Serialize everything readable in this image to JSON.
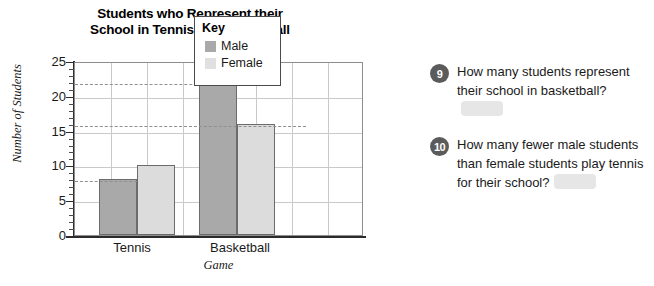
{
  "chart_data": {
    "type": "bar",
    "title": "Students who Represent their School in Tennis and Basketball",
    "title_lines": [
      "Students who Represent their",
      "School in Tennis and Basketball"
    ],
    "xlabel": "Game",
    "ylabel": "Number of Students",
    "categories": [
      "Tennis",
      "Basketball"
    ],
    "series": [
      {
        "name": "Male",
        "values": [
          8,
          22
        ],
        "color": "#a9a9a9"
      },
      {
        "name": "Female",
        "values": [
          10,
          16
        ],
        "color": "#dcdcdc"
      }
    ],
    "ylim": [
      0,
      25
    ],
    "ytick_major": [
      0,
      5,
      10,
      15,
      20,
      25
    ],
    "ytick_labels": [
      "0",
      "5",
      "10",
      "15",
      "20",
      "25"
    ],
    "ytick_minor_step": 1,
    "grid": true,
    "reference_lines": [
      8,
      16,
      22
    ],
    "legend": {
      "title": "Key",
      "position": "inside-top-right",
      "entries": [
        {
          "label": "Male",
          "color": "#a9a9a9"
        },
        {
          "label": "Female",
          "color": "#e0e0e0"
        }
      ]
    }
  },
  "questions": [
    {
      "number": "9",
      "text": "How many students represent their school in basketball?",
      "answer": ""
    },
    {
      "number": "10",
      "text": "How many fewer male students than female students play tennis for their school?",
      "answer": ""
    }
  ]
}
